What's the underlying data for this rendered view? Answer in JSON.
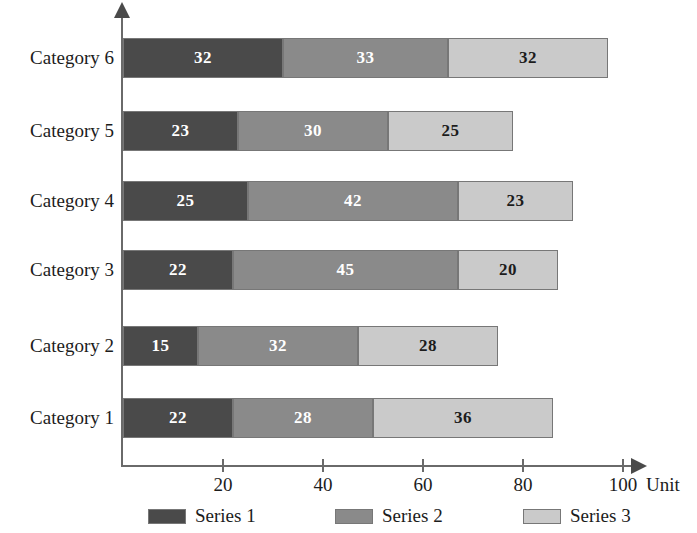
{
  "chart_data": {
    "type": "bar",
    "orientation": "horizontal",
    "stacked": true,
    "title": "",
    "xlabel": "Unit",
    "ylabel": "",
    "xlim": [
      0,
      100
    ],
    "grid": false,
    "legend_position": "bottom",
    "categories": [
      "Category 1",
      "Category 2",
      "Category 3",
      "Category 4",
      "Category 5",
      "Category 6"
    ],
    "xticks": [
      "20",
      "40",
      "60",
      "80",
      "100"
    ],
    "xtick_values": [
      20,
      40,
      60,
      80,
      100
    ],
    "series": [
      {
        "name": "Series 1",
        "color": "#4a4a4a",
        "values": [
          22,
          15,
          22,
          25,
          23,
          32
        ]
      },
      {
        "name": "Series 2",
        "color": "#8a8a8a",
        "values": [
          28,
          32,
          45,
          42,
          30,
          33
        ]
      },
      {
        "name": "Series 3",
        "color": "#cacaca",
        "values": [
          36,
          28,
          20,
          23,
          25,
          32
        ]
      }
    ],
    "totals": [
      86,
      75,
      87,
      90,
      78,
      97
    ]
  },
  "axis": {
    "unit_label": "Unit"
  },
  "legend": {
    "items": [
      {
        "label": "Series 1"
      },
      {
        "label": "Series 2"
      },
      {
        "label": "Series 3"
      }
    ]
  }
}
